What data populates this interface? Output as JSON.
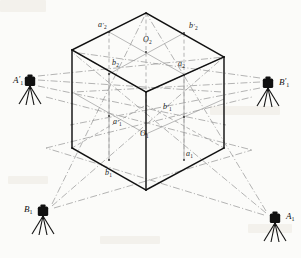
{
  "figure": {
    "background_color": "#fbfbf9",
    "line_color_solid": "#111111",
    "line_color_light": "#8c8c8c",
    "line_color_dash": "#9a9a9a"
  },
  "point_labels": [
    {
      "id": "a2p",
      "base": "a",
      "prime": "′",
      "sub": "2",
      "x": 98,
      "y": 21
    },
    {
      "id": "b2p",
      "base": "b",
      "prime": "′",
      "sub": "2",
      "x": 189,
      "y": 22
    },
    {
      "id": "O2",
      "base": "O",
      "prime": "",
      "sub": "2",
      "x": 143,
      "y": 36
    },
    {
      "id": "b2",
      "base": "b",
      "prime": "",
      "sub": "2",
      "x": 112,
      "y": 59
    },
    {
      "id": "a2",
      "base": "a",
      "prime": "",
      "sub": "2",
      "x": 178,
      "y": 60
    },
    {
      "id": "b1p",
      "base": "b",
      "prime": "′",
      "sub": "1",
      "x": 163,
      "y": 103
    },
    {
      "id": "a1p",
      "base": "a",
      "prime": "′",
      "sub": "1",
      "x": 113,
      "y": 118
    },
    {
      "id": "O1",
      "base": "O",
      "prime": "",
      "sub": "1",
      "x": 140,
      "y": 130
    },
    {
      "id": "a1",
      "base": "a",
      "prime": "",
      "sub": "1",
      "x": 186,
      "y": 150
    },
    {
      "id": "b1",
      "base": "b",
      "prime": "",
      "sub": "1",
      "x": 105,
      "y": 169
    }
  ],
  "camera_stations": [
    {
      "id": "A1p",
      "base": "A",
      "prime": "′",
      "sub": "1",
      "cam_x": 30,
      "cam_y": 82,
      "label_x": 13,
      "label_y": 76,
      "aim": "right"
    },
    {
      "id": "B1p",
      "base": "B",
      "prime": "′",
      "sub": "1",
      "cam_x": 268,
      "cam_y": 84,
      "label_x": 279,
      "label_y": 78,
      "aim": "left"
    },
    {
      "id": "B1",
      "base": "B",
      "prime": "",
      "sub": "1",
      "cam_x": 43,
      "cam_y": 212,
      "label_x": 24,
      "label_y": 205,
      "aim": "right"
    },
    {
      "id": "A1",
      "base": "A",
      "prime": "",
      "sub": "1",
      "cam_x": 275,
      "cam_y": 219,
      "label_x": 286,
      "label_y": 212,
      "aim": "left"
    }
  ],
  "notes": {
    "projection": "isometric",
    "object": "cube control frame",
    "station_count": 4
  }
}
